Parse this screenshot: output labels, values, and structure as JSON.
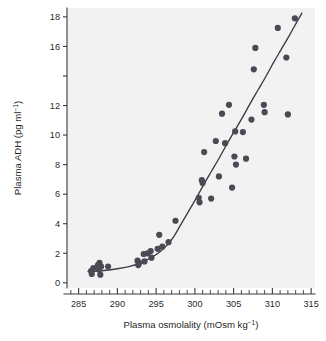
{
  "figure": {
    "background_color": "#ffffff",
    "plot_background_color": "#f2f2f2",
    "marker_color": "#4a4a55",
    "curve_color": "#3c3c46",
    "axis_color": "#3a3a3a"
  },
  "chart_data": {
    "type": "scatter",
    "title": "",
    "xlabel": "Plasma osmolality (mOsm kg⁻¹)",
    "ylabel": "Plasma ADH (pg ml⁻¹)",
    "xlim": [
      283.5,
      315.5
    ],
    "ylim": [
      -0.35,
      18.6
    ],
    "grid": false,
    "legend": null,
    "xticks": [
      285,
      290,
      295,
      300,
      305,
      310,
      315
    ],
    "xtick_labels": [
      "285",
      "290",
      "295",
      "300",
      "305",
      "310",
      "315"
    ],
    "x_minor_tick_step": 1,
    "yticks": [
      0,
      2,
      4,
      6,
      8,
      10,
      12,
      14,
      16,
      18
    ],
    "ytick_labels": [
      "0",
      "2",
      "4",
      "6",
      "8",
      "10",
      "12",
      "",
      "16",
      "18"
    ],
    "series": [
      {
        "name": "Observations",
        "marker": "circle",
        "color": "#4a4a55",
        "points": [
          [
            286.6,
            0.8
          ],
          [
            286.7,
            0.6
          ],
          [
            286.9,
            1.0
          ],
          [
            287.5,
            1.2
          ],
          [
            287.6,
            0.9
          ],
          [
            287.7,
            1.35
          ],
          [
            287.8,
            0.55
          ],
          [
            287.9,
            1.1
          ],
          [
            288.8,
            1.1
          ],
          [
            292.6,
            1.5
          ],
          [
            292.7,
            1.2
          ],
          [
            292.8,
            1.35
          ],
          [
            293.4,
            1.95
          ],
          [
            293.5,
            1.45
          ],
          [
            293.9,
            2.0
          ],
          [
            294.3,
            2.15
          ],
          [
            294.4,
            1.7
          ],
          [
            295.2,
            2.3
          ],
          [
            295.4,
            3.25
          ],
          [
            295.8,
            2.45
          ],
          [
            296.6,
            2.75
          ],
          [
            297.5,
            4.2
          ],
          [
            300.5,
            5.75
          ],
          [
            300.6,
            5.45
          ],
          [
            300.9,
            6.95
          ],
          [
            301.0,
            6.75
          ],
          [
            301.2,
            8.85
          ],
          [
            302.1,
            5.7
          ],
          [
            302.7,
            9.6
          ],
          [
            303.1,
            7.2
          ],
          [
            303.5,
            11.45
          ],
          [
            303.9,
            9.45
          ],
          [
            304.4,
            12.05
          ],
          [
            304.8,
            6.45
          ],
          [
            305.1,
            8.55
          ],
          [
            305.2,
            10.25
          ],
          [
            305.3,
            8.0
          ],
          [
            306.2,
            10.2
          ],
          [
            306.6,
            8.4
          ],
          [
            307.3,
            11.05
          ],
          [
            307.6,
            14.45
          ],
          [
            307.8,
            15.9
          ],
          [
            308.9,
            12.05
          ],
          [
            309.0,
            11.55
          ],
          [
            310.7,
            17.25
          ],
          [
            311.8,
            15.25
          ],
          [
            312.0,
            11.4
          ],
          [
            312.9,
            17.9
          ]
        ]
      }
    ],
    "fit_curve": {
      "name": "Fitted response curve",
      "color": "#3c3c46",
      "points": [
        [
          286.2,
          0.78
        ],
        [
          288.0,
          0.82
        ],
        [
          290.0,
          0.95
        ],
        [
          291.5,
          1.1
        ],
        [
          293.0,
          1.35
        ],
        [
          294.5,
          1.75
        ],
        [
          295.5,
          2.1
        ],
        [
          296.5,
          2.6
        ],
        [
          297.3,
          3.15
        ],
        [
          298.2,
          3.95
        ],
        [
          299.2,
          4.85
        ],
        [
          300.2,
          5.75
        ],
        [
          301.2,
          6.7
        ],
        [
          302.2,
          7.6
        ],
        [
          303.2,
          8.5
        ],
        [
          304.2,
          9.45
        ],
        [
          305.2,
          10.35
        ],
        [
          306.2,
          11.25
        ],
        [
          307.2,
          12.2
        ],
        [
          308.2,
          13.1
        ],
        [
          309.2,
          14.0
        ],
        [
          310.2,
          14.95
        ],
        [
          311.2,
          15.85
        ],
        [
          312.2,
          16.75
        ],
        [
          313.2,
          17.7
        ],
        [
          313.8,
          18.25
        ]
      ]
    }
  }
}
